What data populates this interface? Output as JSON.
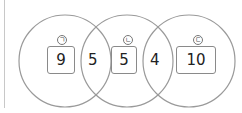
{
  "venn": {
    "circles": [
      {
        "label": "ㄱ",
        "value": "9"
      },
      {
        "label": "ㄴ",
        "value": "5"
      },
      {
        "label": "ㄷ",
        "value": "10"
      }
    ],
    "overlaps": {
      "left_middle": "5",
      "middle_right": "4"
    },
    "stroke_color": "#9a9a9a"
  }
}
